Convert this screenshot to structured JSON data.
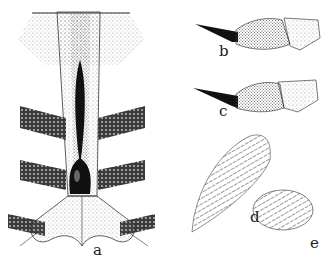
{
  "figure": {
    "panels": [
      {
        "id": "a",
        "label": "a",
        "subject": "ventral-plate-with-banded-segments"
      },
      {
        "id": "b",
        "label": "b",
        "subject": "tarsal-segment-claw"
      },
      {
        "id": "c",
        "label": "c",
        "subject": "tarsal-segment-claw-variant"
      },
      {
        "id": "d",
        "label": "d",
        "subject": "hairy-lobe"
      },
      {
        "id": "e",
        "label": "e",
        "subject": "setose-lobe"
      }
    ],
    "colors": {
      "ink": "#1a1a1a",
      "stipple": "#555555",
      "paper": "#ffffff"
    }
  }
}
